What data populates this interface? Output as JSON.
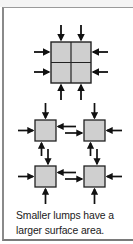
{
  "caption": {
    "line1": "Smaller lumps have a",
    "line2": "larger surface area."
  },
  "colors": {
    "square_fill": "#cfcfcf",
    "outline": "#222222",
    "arrow": "#111111",
    "frame_border": "#8a8a8a"
  },
  "diagram": {
    "large_lump": {
      "label": "large lump divided into 4 quarters",
      "inward_arrows": 8
    },
    "small_lumps": {
      "count": 4,
      "inward_arrows_each": 2,
      "exchange_pairs": 4
    }
  }
}
